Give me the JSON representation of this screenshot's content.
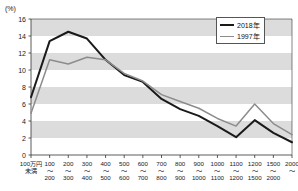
{
  "chart_data": {
    "type": "line",
    "title": "",
    "xlabel": "",
    "ylabel": "",
    "unit_label": "(%)",
    "ylim": [
      0,
      16
    ],
    "yticks": [
      0,
      2,
      4,
      6,
      8,
      10,
      12,
      14,
      16
    ],
    "grid": "horizontal-banded",
    "legend_position": "top-right",
    "categories": [
      "100万円未満",
      "100〜200",
      "200〜300",
      "300〜400",
      "400〜500",
      "500〜600",
      "600〜700",
      "700〜800",
      "800〜900",
      "900〜1000",
      "1000〜1100",
      "1100〜1200",
      "1200〜1500",
      "1500〜2000",
      "2000〜"
    ],
    "category_top": [
      "100万円",
      "100",
      "200",
      "300",
      "400",
      "500",
      "600",
      "700",
      "800",
      "900",
      "1000",
      "1100",
      "1200",
      "1500",
      "2000"
    ],
    "category_mid": [
      "未満",
      "〜",
      "〜",
      "〜",
      "〜",
      "〜",
      "〜",
      "〜",
      "〜",
      "〜",
      "〜",
      "〜",
      "〜",
      "〜",
      "〜"
    ],
    "category_bot": [
      "",
      "200",
      "300",
      "400",
      "500",
      "600",
      "700",
      "800",
      "900",
      "1000",
      "1100",
      "1200",
      "1500",
      "2000",
      ""
    ],
    "series": [
      {
        "name": "2018年",
        "color": "#1a1a1a",
        "width": 2.0,
        "values": [
          6.8,
          13.4,
          14.5,
          13.7,
          11.2,
          9.4,
          8.6,
          6.6,
          5.4,
          4.6,
          3.4,
          2.1,
          4.1,
          2.6,
          1.5
        ]
      },
      {
        "name": "1997年",
        "color": "#8c8c8c",
        "width": 1.5,
        "values": [
          4.9,
          11.2,
          10.7,
          11.5,
          11.2,
          9.6,
          8.7,
          7.1,
          6.3,
          5.5,
          4.3,
          3.4,
          6.0,
          3.7,
          2.4
        ]
      }
    ]
  },
  "legend": {
    "items": [
      {
        "label": "2018年",
        "color": "#1a1a1a"
      },
      {
        "label": "1997年",
        "color": "#8c8c8c"
      }
    ]
  },
  "colors": {
    "band": "#dcdcdc",
    "axis": "#333333",
    "background": "#ffffff"
  }
}
